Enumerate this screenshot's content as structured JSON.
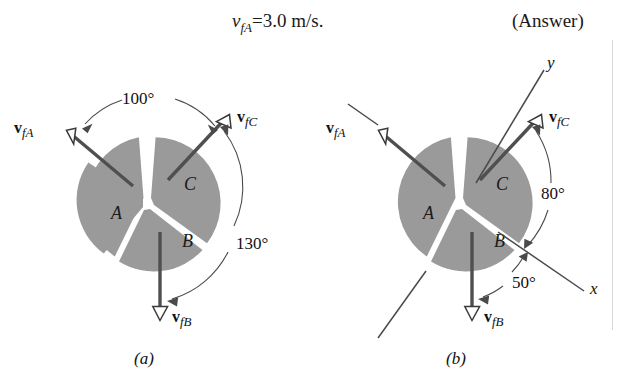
{
  "page": {
    "background_color": "#ffffff",
    "ink_color": "#1a1a1a",
    "wedge_fill": "#9a9a9a",
    "arrow_color": "#4f4f4f"
  },
  "equation": {
    "variable": "v",
    "variable_subscript": "fA",
    "relation": "=",
    "value": "3.0 m/s.",
    "full_text": "v_fA = 3.0 m/s.",
    "answer_tag": "(Answer)"
  },
  "panels": [
    {
      "id": "a",
      "caption": "(a)",
      "segments": [
        {
          "name": "A",
          "label": "A"
        },
        {
          "name": "B",
          "label": "B"
        },
        {
          "name": "C",
          "label": "C"
        }
      ],
      "vectors": [
        {
          "name": "vfA",
          "bold_symbol": "v",
          "subscript": "fA",
          "direction_deg": 145
        },
        {
          "name": "vfC",
          "bold_symbol": "v",
          "subscript": "fC",
          "direction_deg": 45
        },
        {
          "name": "vfB",
          "bold_symbol": "v",
          "subscript": "fB",
          "direction_deg": 270
        }
      ],
      "angles": [
        {
          "name": "angle-100",
          "label": "100°",
          "value": 100,
          "between": [
            "vfA",
            "vfC"
          ]
        },
        {
          "name": "angle-130",
          "label": "130°",
          "value": 130,
          "between": [
            "vfC",
            "vfB"
          ]
        }
      ],
      "axes": []
    },
    {
      "id": "b",
      "caption": "(b)",
      "segments": [
        {
          "name": "A",
          "label": "A"
        },
        {
          "name": "B",
          "label": "B"
        },
        {
          "name": "C",
          "label": "C"
        }
      ],
      "vectors": [
        {
          "name": "vfA",
          "bold_symbol": "v",
          "subscript": "fA",
          "direction_deg": 145
        },
        {
          "name": "vfC",
          "bold_symbol": "v",
          "subscript": "fC",
          "direction_deg": 45
        },
        {
          "name": "vfB",
          "bold_symbol": "v",
          "subscript": "fB",
          "direction_deg": 270
        }
      ],
      "angles": [
        {
          "name": "angle-80",
          "label": "80°",
          "value": 80,
          "between": [
            "vfC",
            "x-axis"
          ]
        },
        {
          "name": "angle-50",
          "label": "50°",
          "value": 50,
          "between": [
            "x-axis",
            "vfB"
          ]
        }
      ],
      "axes": [
        {
          "name": "y-axis",
          "label": "y",
          "direction_deg": 55
        },
        {
          "name": "x-axis",
          "label": "x",
          "direction_deg": -35
        }
      ]
    }
  ]
}
